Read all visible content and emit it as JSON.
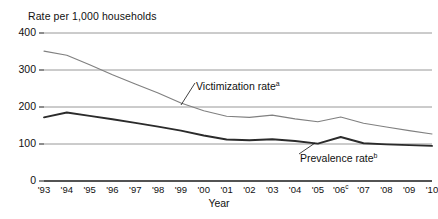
{
  "axes": {
    "y_title": "Rate per 1,000 households",
    "x_title": "Year",
    "y_ticks": [
      "400",
      "300",
      "200",
      "100",
      "0"
    ],
    "x_ticks": [
      "'93",
      "'94",
      "'95",
      "'96",
      "'97",
      "'98",
      "'99",
      "'00",
      "'01",
      "'02",
      "'03",
      "'04",
      "'05",
      "'06",
      "'07",
      "'08",
      "'09",
      "'10"
    ],
    "x_tick_superscripts": [
      "",
      "",
      "",
      "",
      "",
      "",
      "",
      "",
      "",
      "",
      "",
      "",
      "",
      "c",
      "",
      "",
      "",
      ""
    ]
  },
  "labels": {
    "victimization": "Victimization rate",
    "victimization_superscript": "a",
    "prevalence": "Prevalence rate",
    "prevalence_superscript": "b"
  },
  "colors": {
    "victimization_line": "#808080",
    "prevalence_line": "#2b2b2b",
    "gridline": "#8c8c8c",
    "axis": "#1a1a1a",
    "text": "#111111",
    "background": "#ffffff"
  },
  "chart_data": {
    "type": "line",
    "title": "",
    "xlabel": "Year",
    "ylabel": "Rate per 1,000 households",
    "ylim": [
      0,
      400
    ],
    "yticks": [
      0,
      100,
      200,
      300,
      400
    ],
    "grid": true,
    "legend": "inline-annotations",
    "x": [
      "'93",
      "'94",
      "'95",
      "'96",
      "'97",
      "'98",
      "'99",
      "'00",
      "'01",
      "'02",
      "'03",
      "'04",
      "'05",
      "'06",
      "'07",
      "'08",
      "'09",
      "'10"
    ],
    "series": [
      {
        "name": "Victimization rate",
        "color": "#808080",
        "values": [
          351,
          340,
          314,
          287,
          262,
          238,
          211,
          190,
          175,
          172,
          178,
          168,
          160,
          173,
          156,
          146,
          136,
          127
        ]
      },
      {
        "name": "Prevalence rate",
        "color": "#2b2b2b",
        "values": [
          172,
          185,
          176,
          167,
          157,
          147,
          136,
          123,
          112,
          110,
          113,
          108,
          101,
          119,
          102,
          99,
          97,
          95
        ]
      }
    ]
  }
}
